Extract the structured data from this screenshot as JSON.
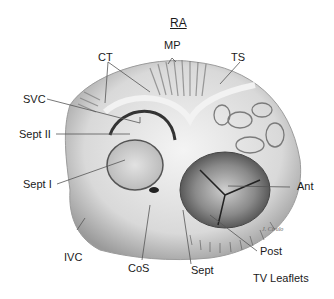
{
  "title": "RA",
  "labels": {
    "mp": "MP",
    "ct": "CT",
    "ts": "TS",
    "svc": "SVC",
    "sept2": "Sept II",
    "sept1": "Sept I",
    "ant": "Ant",
    "ivc": "IVC",
    "cos": "CoS",
    "sept": "Sept",
    "post": "Post",
    "tv_leaflets": "TV Leaflets"
  },
  "signature": "J. Cirulo",
  "colors": {
    "background": "#ffffff",
    "tissue_light": "#e6e6e6",
    "tissue_mid": "#bdbdbd",
    "tissue_dark": "#6e6e6e",
    "leader_line": "#555555"
  }
}
